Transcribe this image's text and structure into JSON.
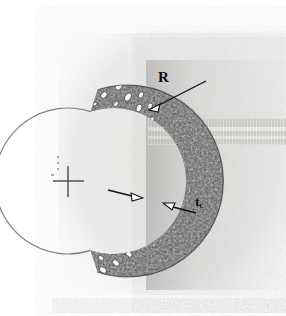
{
  "figure": {
    "panel_label": "a)",
    "background_color": "#ffffff",
    "scan_paper_color": "#e9e9e7",
    "wall_color": "#4a4a4a",
    "pore_color": "#fbfbfb",
    "ink_color": "#111111"
  },
  "annotations": {
    "radius": {
      "label": "R",
      "meaning": "outer radius leader line pointing to outer wall surface",
      "leader_from": [
        206,
        81
      ],
      "leader_to": [
        151,
        109
      ]
    },
    "thickness": {
      "label": "t",
      "subscript": "c",
      "meaning": "wall thickness callout",
      "leader_from": [
        196,
        213
      ],
      "leader_to": [
        164,
        203
      ]
    },
    "inner_surface_arrow": {
      "label": "",
      "meaning": "arrow pointing right at the inner wall surface",
      "leader_from": [
        110,
        193
      ],
      "leader_to": [
        141,
        198
      ]
    },
    "centre_mark": {
      "label": "",
      "meaning": "crosshair marking the centre of curvature",
      "position": [
        68,
        181
      ],
      "arm_length": 15
    }
  },
  "geometry": {
    "centre_x": 68,
    "centre_y": 181,
    "inner_radius": 73,
    "outer_radius": 96,
    "arc_start_deg": -72,
    "arc_end_deg": 72
  }
}
